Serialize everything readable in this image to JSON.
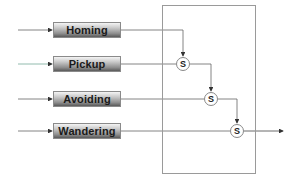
{
  "diagram": {
    "type": "subsumption-architecture",
    "behaviors": [
      {
        "label": "Homing"
      },
      {
        "label": "Pickup"
      },
      {
        "label": "Avoiding"
      },
      {
        "label": "Wandering"
      }
    ],
    "suppressors": [
      {
        "label": "S"
      },
      {
        "label": "S"
      },
      {
        "label": "S"
      }
    ],
    "colors": {
      "line": "#555555",
      "box_border": "#9a9a9a"
    }
  }
}
